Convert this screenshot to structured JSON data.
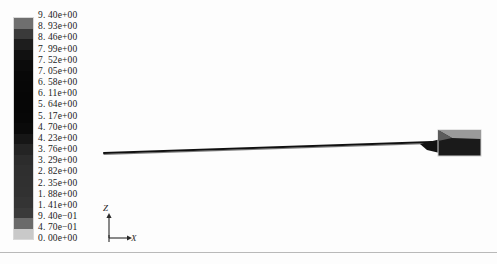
{
  "view": {
    "background_color": "#fdfdfd",
    "frame_color": "#b9b9b9"
  },
  "legend": {
    "name": "contour-colorbar",
    "orientation": "vertical",
    "min_value": "0.00e+00",
    "max_value": "9.40e+00",
    "labels": [
      "9. 40e+00",
      "8. 93e+00",
      "8. 46e+00",
      "7. 99e+00",
      "7. 52e+00",
      "7. 05e+00",
      "6. 58e+00",
      "6. 11e+00",
      "5. 64e+00",
      "5. 17e+00",
      "4. 70e+00",
      "4. 23e+00",
      "3. 76e+00",
      "3. 29e+00",
      "2. 82e+00",
      "2. 35e+00",
      "1. 88e+00",
      "1. 41e+00",
      "9. 40e−01",
      "4. 70e−01",
      "0. 00e+00"
    ],
    "band_colors": [
      "#6f6f6f",
      "#3a3a3a",
      "#1d1d1d",
      "#111111",
      "#0b0b0b",
      "#080808",
      "#070707",
      "#060606",
      "#060606",
      "#070707",
      "#0a0a0a",
      "#161616",
      "#242424",
      "#2c2c2c",
      "#2f2f2f",
      "#303030",
      "#313131",
      "#343434",
      "#3a3a3a",
      "#6a6a6a",
      "#c9c9c9"
    ]
  },
  "chart_data": {
    "type": "heatmap",
    "title": "",
    "xlabel": "",
    "ylabel": "",
    "colorbar_label": "",
    "colorbar_ticks": [
      9.4,
      8.93,
      8.46,
      7.99,
      7.52,
      7.05,
      6.58,
      6.11,
      5.64,
      5.17,
      4.7,
      4.23,
      3.76,
      3.29,
      2.82,
      2.35,
      1.88,
      1.41,
      0.94,
      0.47,
      0.0
    ],
    "colorbar_range": [
      0.0,
      9.4
    ],
    "colorbar_step": 0.47,
    "colormap": "grayscale",
    "legend_position": "left",
    "grid": false
  },
  "geometry": {
    "name": "slender-beam-model",
    "beam": {
      "start_x": 4,
      "start_y": 145,
      "end_x": 332,
      "end_y": 134,
      "color": "#101010"
    },
    "block": {
      "name": "end-block",
      "x": 338,
      "y": 122,
      "width": 43,
      "height": 26,
      "body_color": "#1a1a1a",
      "highlight_color": "#9a9a9a",
      "border_color": "#cfcfcf"
    }
  },
  "axis_triad": {
    "name": "orientation-triad",
    "z_label": "Z",
    "x_label": "X",
    "y_label": "Y",
    "color": "#2a2a2a"
  }
}
